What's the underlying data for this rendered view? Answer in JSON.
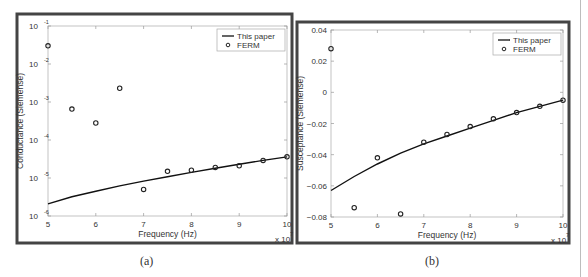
{
  "chart_data": [
    {
      "panel": "a",
      "type": "line",
      "title": "",
      "xlabel": "Frequency (Hz)",
      "ylabel": "Conductance (Siemense)",
      "x_multiplier": "x 10^7",
      "xlim": [
        5,
        10
      ],
      "ylim": [
        1e-06,
        0.1
      ],
      "yscale": "log",
      "xticks": [
        "5",
        "6",
        "7",
        "8",
        "9",
        "10"
      ],
      "yticks": [
        "10^-6",
        "10^-5",
        "10^-4",
        "10^-3",
        "10^-2",
        "10^-1"
      ],
      "grid": false,
      "legend_position": "upper right",
      "x": [
        5.0,
        5.5,
        6.0,
        6.5,
        7.0,
        7.5,
        8.0,
        8.5,
        9.0,
        9.5,
        10.0
      ],
      "series": [
        {
          "name": "This paper",
          "style": "line",
          "values": [
            2.1e-06,
            3.2e-06,
            4.5e-06,
            6.2e-06,
            8.3e-06,
            1.08e-05,
            1.4e-05,
            1.8e-05,
            2.3e-05,
            2.9e-05,
            3.6e-05
          ]
        },
        {
          "name": "FERM",
          "style": "marker",
          "values": [
            0.03,
            0.00065,
            0.00028,
            0.0023,
            5e-06,
            1.5e-05,
            1.6e-05,
            1.9e-05,
            2.1e-05,
            2.9e-05,
            3.6e-05
          ]
        }
      ]
    },
    {
      "panel": "b",
      "type": "line",
      "title": "",
      "xlabel": "Frequency (Hz)",
      "ylabel": "Susceptance (Siemense)",
      "x_multiplier": "x 10^7",
      "xlim": [
        5,
        10
      ],
      "ylim": [
        -0.08,
        0.04
      ],
      "yscale": "linear",
      "xticks": [
        "5",
        "6",
        "7",
        "8",
        "9",
        "10"
      ],
      "yticks": [
        "-0.08",
        "-0.06",
        "-0.04",
        "-0.02",
        "0",
        "0.02",
        "0.04"
      ],
      "grid": false,
      "legend_position": "upper right",
      "x": [
        5.0,
        5.5,
        6.0,
        6.5,
        7.0,
        7.5,
        8.0,
        8.5,
        9.0,
        9.5,
        10.0
      ],
      "series": [
        {
          "name": "This paper",
          "style": "line",
          "values": [
            -0.063,
            -0.054,
            -0.046,
            -0.039,
            -0.033,
            -0.028,
            -0.023,
            -0.018,
            -0.013,
            -0.009,
            -0.005
          ]
        },
        {
          "name": "FERM",
          "style": "marker",
          "values": [
            0.028,
            -0.074,
            -0.042,
            -0.078,
            -0.032,
            -0.027,
            -0.022,
            -0.017,
            -0.013,
            -0.009,
            -0.005
          ]
        }
      ]
    }
  ],
  "captions": {
    "a": "(a)",
    "b": "(b)"
  },
  "legend": {
    "line_label": "This paper",
    "marker_label": "FERM"
  },
  "axis_multiplier_text": "x 10",
  "axis_multiplier_exp": "7"
}
